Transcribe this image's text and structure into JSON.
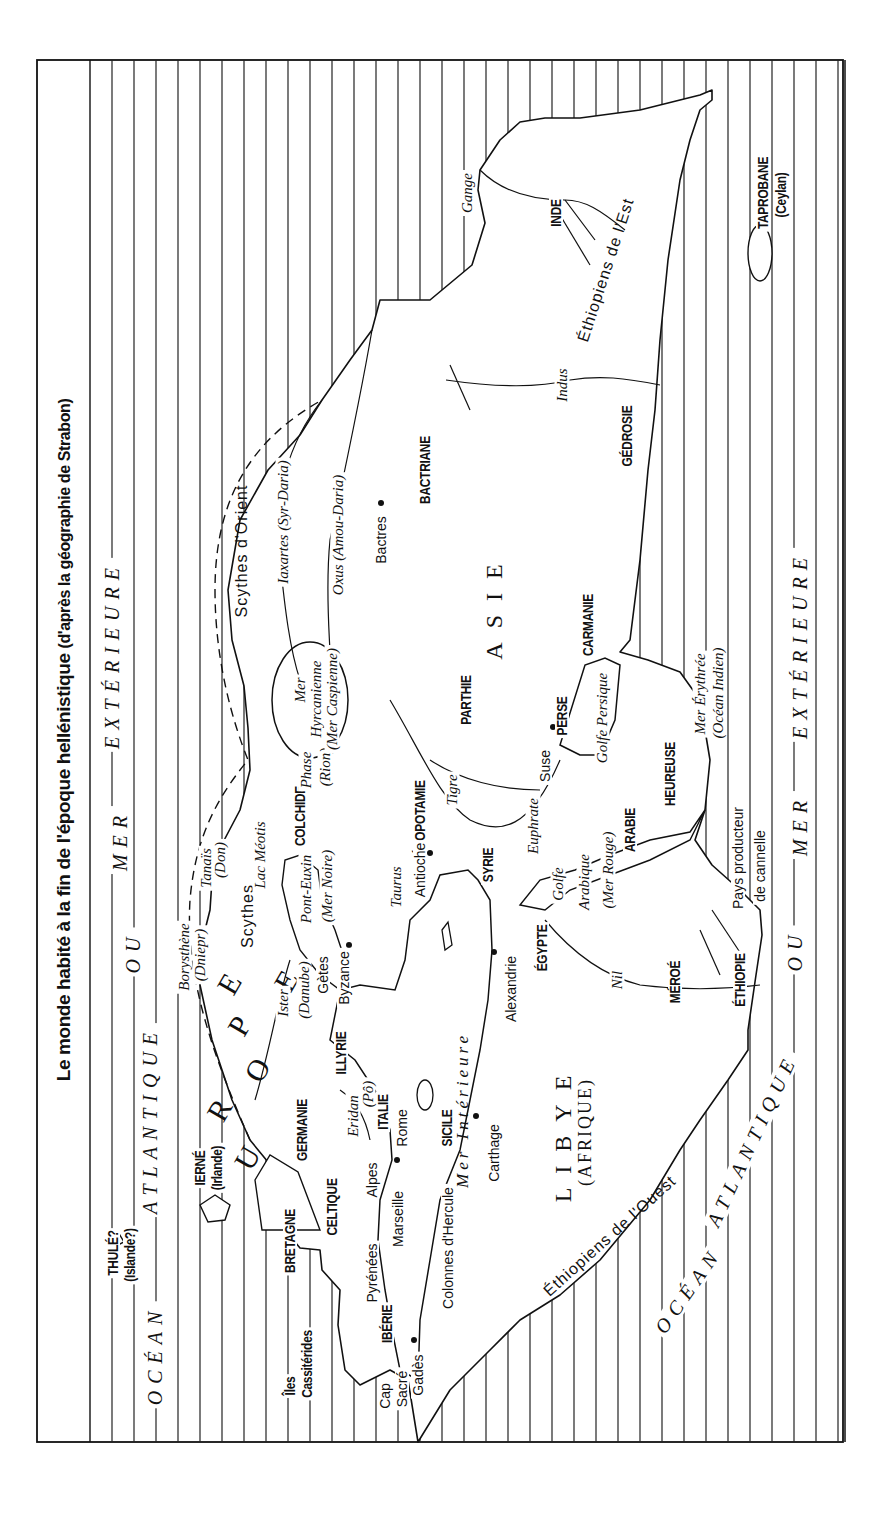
{
  "title": {
    "main": "Le monde habité à la fin de l'époque hellénistique",
    "subtitle": "(d'après la géographie de Strabon)"
  },
  "oceans": [
    {
      "id": "ocean-atlantique-nord",
      "text": "OCÉAN — ATLANTIQUE — OU — MER — EXTÉRIEURE",
      "parts": [
        "OCÉAN",
        "ATLANTIQUE",
        "OU",
        "MER",
        "EXTÉRIEURE"
      ]
    },
    {
      "id": "ocean-atlantique-sud",
      "parts": [
        "OCÉAN",
        "ATLANTIQUE",
        "OU",
        "MER",
        "EXTÉRIEURE"
      ]
    }
  ],
  "labels": [
    {
      "id": "thule",
      "cls": "region",
      "text": "THULÉ?",
      "x": 113,
      "y": 1253
    },
    {
      "id": "islande",
      "cls": "region",
      "text": "(Islande?)",
      "x": 130,
      "y": 1255
    },
    {
      "id": "ierne",
      "cls": "region",
      "text": "IERNÉ",
      "x": 200,
      "y": 1168
    },
    {
      "id": "irlande",
      "cls": "region",
      "text": "(Irlande)",
      "x": 217,
      "y": 1168
    },
    {
      "id": "iles",
      "cls": "region",
      "text": "Îles",
      "x": 290,
      "y": 1386
    },
    {
      "id": "cassiterides",
      "cls": "region",
      "text": "Cassitérides",
      "x": 307,
      "y": 1364
    },
    {
      "id": "bretagne",
      "cls": "region",
      "text": "BRETAGNE",
      "x": 290,
      "y": 1241
    },
    {
      "id": "germanie",
      "cls": "region",
      "text": "GERMANIE",
      "x": 302,
      "y": 1130
    },
    {
      "id": "celtique",
      "cls": "region",
      "text": "CELTIQUE",
      "x": 332,
      "y": 1207
    },
    {
      "id": "iberie",
      "cls": "region",
      "text": "IBÉRIE",
      "x": 387,
      "y": 1324
    },
    {
      "id": "cap",
      "cls": "city",
      "text": "Cap",
      "x": 385,
      "y": 1396
    },
    {
      "id": "sacre",
      "cls": "city",
      "text": "Sacré",
      "x": 402,
      "y": 1389
    },
    {
      "id": "gades",
      "cls": "city",
      "text": "Gadès",
      "x": 418,
      "y": 1375
    },
    {
      "id": "pyrenees",
      "cls": "city",
      "text": "Pyrénées",
      "x": 372,
      "y": 1273
    },
    {
      "id": "marseille",
      "cls": "city",
      "text": "Marseille",
      "x": 398,
      "y": 1219
    },
    {
      "id": "alpes",
      "cls": "city",
      "text": "Alpes",
      "x": 372,
      "y": 1180
    },
    {
      "id": "rome",
      "cls": "city",
      "text": "Rome",
      "x": 402,
      "y": 1128
    },
    {
      "id": "italie",
      "cls": "region",
      "text": "ITALIE",
      "x": 383,
      "y": 1112
    },
    {
      "id": "illyrie",
      "cls": "region",
      "text": "ILLYRIE",
      "x": 341,
      "y": 1053
    },
    {
      "id": "eridan",
      "cls": "river",
      "text": "Eridan",
      "x": 353,
      "y": 1116
    },
    {
      "id": "po",
      "cls": "river",
      "text": "(Pô)",
      "x": 368,
      "y": 1094
    },
    {
      "id": "colonnes",
      "cls": "city",
      "text": "Colonnes d'Hercule",
      "x": 448,
      "y": 1248
    },
    {
      "id": "sicile",
      "cls": "region",
      "text": "SICILE",
      "x": 447,
      "y": 1128
    },
    {
      "id": "mer-interieure",
      "cls": "sea",
      "text": "Mer Intérieure",
      "x": 462,
      "y": 1110
    },
    {
      "id": "carthage",
      "cls": "city",
      "text": "Carthage",
      "x": 494,
      "y": 1153
    },
    {
      "id": "ister",
      "cls": "river",
      "text": "Ister",
      "x": 283,
      "y": 1003
    },
    {
      "id": "danube",
      "cls": "river",
      "text": "(Danube)",
      "x": 304,
      "y": 990
    },
    {
      "id": "getes",
      "cls": "city",
      "text": "Gètes",
      "x": 323,
      "y": 975
    },
    {
      "id": "byzance",
      "cls": "city",
      "text": "Byzance",
      "x": 344,
      "y": 978
    },
    {
      "id": "borysthene",
      "cls": "river",
      "text": "Borysthène",
      "x": 184,
      "y": 957
    },
    {
      "id": "dniepr",
      "cls": "river",
      "text": "(Dniepr)",
      "x": 200,
      "y": 955
    },
    {
      "id": "scythes",
      "cls": "people",
      "text": "Scythes",
      "x": 248,
      "y": 916
    },
    {
      "id": "tanais",
      "cls": "river",
      "text": "Tanaïs",
      "x": 206,
      "y": 868
    },
    {
      "id": "don",
      "cls": "river",
      "text": "(Don)",
      "x": 220,
      "y": 860
    },
    {
      "id": "lac-meotis",
      "cls": "river",
      "text": "Lac Méotis",
      "x": 260,
      "y": 855
    },
    {
      "id": "pont-euxin",
      "cls": "river",
      "text": "Pont-Euxin",
      "x": 306,
      "y": 889
    },
    {
      "id": "mer-noire",
      "cls": "river",
      "text": "(Mer Noire)",
      "x": 327,
      "y": 886
    },
    {
      "id": "colchide",
      "cls": "region",
      "text": "COLCHIDE",
      "x": 300,
      "y": 816
    },
    {
      "id": "phase",
      "cls": "river",
      "text": "Phase",
      "x": 306,
      "y": 770
    },
    {
      "id": "rion",
      "cls": "river",
      "text": "(Rion)",
      "x": 325,
      "y": 767
    },
    {
      "id": "mer-hyrcanienne-1",
      "cls": "river",
      "text": "Mer",
      "x": 300,
      "y": 690
    },
    {
      "id": "mer-hyrcanienne-2",
      "cls": "river",
      "text": "Hyrcanienne",
      "x": 316,
      "y": 699
    },
    {
      "id": "mer-hyrcanienne-3",
      "cls": "river",
      "text": "(Mer Caspienne)",
      "x": 332,
      "y": 699
    },
    {
      "id": "scythes-orient",
      "cls": "people",
      "text": "Scythes d'Orient",
      "x": 242,
      "y": 551
    },
    {
      "id": "iaxartes",
      "cls": "river",
      "text": "Iaxartes (Syr-Daria)",
      "x": 283,
      "y": 522
    },
    {
      "id": "oxus",
      "cls": "river",
      "text": "Oxus (Amou-Daria)",
      "x": 338,
      "y": 535
    },
    {
      "id": "bactres",
      "cls": "city",
      "text": "Bactres",
      "x": 381,
      "y": 540
    },
    {
      "id": "bactriane",
      "cls": "region",
      "text": "BACTRIANE",
      "x": 425,
      "y": 470
    },
    {
      "id": "tigre",
      "cls": "river",
      "text": "Tigre",
      "x": 452,
      "y": 790
    },
    {
      "id": "mesopotamie",
      "cls": "region",
      "text": "MÉSOPOTAMIE",
      "x": 420,
      "y": 823
    },
    {
      "id": "taurus",
      "cls": "river",
      "text": "Taurus",
      "x": 396,
      "y": 887
    },
    {
      "id": "antioche",
      "cls": "city",
      "text": "Antioche",
      "x": 420,
      "y": 870
    },
    {
      "id": "syrie",
      "cls": "region",
      "text": "SYRIE",
      "x": 488,
      "y": 865
    },
    {
      "id": "euphrate",
      "cls": "river",
      "text": "Euphrate",
      "x": 533,
      "y": 826
    },
    {
      "id": "parthie",
      "cls": "region",
      "text": "PARTHIE",
      "x": 466,
      "y": 700
    },
    {
      "id": "asie",
      "cls": "continent",
      "text": "ASIE",
      "x": 494,
      "y": 605
    },
    {
      "id": "suse",
      "cls": "city",
      "text": "Suse",
      "x": 545,
      "y": 766
    },
    {
      "id": "perse",
      "cls": "region",
      "text": "PERSE",
      "x": 562,
      "y": 716
    },
    {
      "id": "golfe-persique",
      "cls": "river",
      "text": "Golfe Persique",
      "x": 602,
      "y": 718
    },
    {
      "id": "carmanie",
      "cls": "region",
      "text": "CARMANIE",
      "x": 588,
      "y": 625
    },
    {
      "id": "heureuse",
      "cls": "region",
      "text": "HEUREUSE",
      "x": 670,
      "y": 774
    },
    {
      "id": "arabie",
      "cls": "region",
      "text": "ARABIE",
      "x": 630,
      "y": 830
    },
    {
      "id": "golfe-arabique-1",
      "cls": "river",
      "text": "Golfe",
      "x": 558,
      "y": 884
    },
    {
      "id": "golfe-arabique-2",
      "cls": "river",
      "text": "Arabique",
      "x": 584,
      "y": 882
    },
    {
      "id": "golfe-arabique-3",
      "cls": "river",
      "text": "(Mer Rouge)",
      "x": 608,
      "y": 870
    },
    {
      "id": "egypte",
      "cls": "region",
      "text": "ÉGYPTE",
      "x": 542,
      "y": 948
    },
    {
      "id": "alexandrie",
      "cls": "city",
      "text": "Alexandrie",
      "x": 511,
      "y": 989
    },
    {
      "id": "nil",
      "cls": "river",
      "text": "Nil",
      "x": 617,
      "y": 980
    },
    {
      "id": "meroe",
      "cls": "region",
      "text": "MÉROÉ",
      "x": 675,
      "y": 982
    },
    {
      "id": "ethiopie",
      "cls": "region",
      "text": "ÉTHIOPIE",
      "x": 740,
      "y": 980
    },
    {
      "id": "pays-producteur",
      "cls": "city",
      "text": "Pays producteur",
      "x": 738,
      "y": 858
    },
    {
      "id": "de-cannelle",
      "cls": "city",
      "text": "de cannelle",
      "x": 760,
      "y": 866
    },
    {
      "id": "mer-erythree",
      "cls": "river",
      "text": "Mer Érythrée",
      "x": 700,
      "y": 694
    },
    {
      "id": "ocean-indien",
      "cls": "river",
      "text": "(Océan Indien)",
      "x": 718,
      "y": 693
    },
    {
      "id": "gedrosie",
      "cls": "region",
      "text": "GÉDROSIE",
      "x": 627,
      "y": 436
    },
    {
      "id": "indus",
      "cls": "river",
      "text": "Indus",
      "x": 562,
      "y": 385
    },
    {
      "id": "inde",
      "cls": "region",
      "text": "INDE",
      "x": 556,
      "y": 213
    },
    {
      "id": "gange",
      "cls": "river",
      "text": "Gange",
      "x": 467,
      "y": 193
    },
    {
      "id": "ethiopiens-est",
      "cls": "people",
      "text": "Éthiopiens de l'Est",
      "x": 606,
      "y": 270,
      "rot": -72
    },
    {
      "id": "taprobane",
      "cls": "region",
      "text": "TAPROBANE",
      "x": 763,
      "y": 193
    },
    {
      "id": "ceylan",
      "cls": "region",
      "text": "(Ceylan)",
      "x": 781,
      "y": 195
    },
    {
      "id": "libye",
      "cls": "continent",
      "text": "LIBYE",
      "x": 563,
      "y": 1132
    },
    {
      "id": "afrique",
      "cls": "continent",
      "text": "(AFRIQUE)",
      "x": 585,
      "y": 1132,
      "small": true
    },
    {
      "id": "ethiopiens-ouest",
      "cls": "people",
      "text": "Éthiopiens de l'Ouest",
      "x": 610,
      "y": 1236,
      "rot": -42
    }
  ],
  "europe_letters": [
    {
      "ch": "E",
      "x": 233,
      "y": 978
    },
    {
      "ch": "U",
      "x": 251,
      "y": 1152
    },
    {
      "ch": "R",
      "x": 223,
      "y": 1104
    },
    {
      "ch": "O",
      "x": 261,
      "y": 1064
    },
    {
      "ch": "P",
      "x": 243,
      "y": 1020
    },
    {
      "ch": "E",
      "x": 290,
      "y": 975
    }
  ]
}
